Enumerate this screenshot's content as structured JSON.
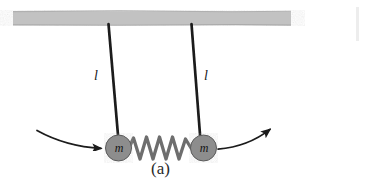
{
  "figure": {
    "caption": "(a)",
    "background_color": "#ffffff",
    "ceiling": {
      "name": "ceiling-bar",
      "color": "#c2c2c2",
      "edge_color": "#a8a8a8",
      "x": 13,
      "y": 11,
      "width": 278,
      "height": 14
    },
    "strings": [
      {
        "name": "pendulum-string-left",
        "color": "#1a1a1a",
        "x1": 108.5,
        "y1": 24,
        "x2": 118.5,
        "y2": 141,
        "width": 2.6,
        "length_label": "l"
      },
      {
        "name": "pendulum-string-right",
        "color": "#1a1a1a",
        "x1": 191.5,
        "y1": 24,
        "x2": 200.5,
        "y2": 141,
        "width": 2.6,
        "length_label": "l"
      }
    ],
    "masses": [
      {
        "name": "mass-left",
        "label": "m",
        "fill": "#8d8d8d",
        "stroke": "#555555",
        "cx": 118.5,
        "cy": 148,
        "r": 13
      },
      {
        "name": "mass-right",
        "label": "m",
        "fill": "#8d8d8d",
        "stroke": "#555555",
        "cx": 203.5,
        "cy": 148,
        "r": 13
      }
    ],
    "spring": {
      "name": "coupling-spring",
      "color": "#6e6e6e",
      "x_start": 131,
      "x_end": 191,
      "y_center": 148,
      "amplitude": 11,
      "coils": 5.5,
      "stroke_width": 3.2
    },
    "arrows": [
      {
        "name": "motion-arrow-left",
        "direction": "right",
        "color": "#1a1a1a",
        "path": "M 37 130 C 55 140, 78 147, 103 148.5"
      },
      {
        "name": "motion-arrow-right",
        "direction": "up-right",
        "color": "#1a1a1a",
        "path": "M 218 149 C 240 147, 258 139, 272 128"
      }
    ],
    "edge_artifact": {
      "name": "page-edge-artifact",
      "color": "#ededed",
      "x": 356,
      "y": 7,
      "width": 3,
      "height": 34
    }
  }
}
